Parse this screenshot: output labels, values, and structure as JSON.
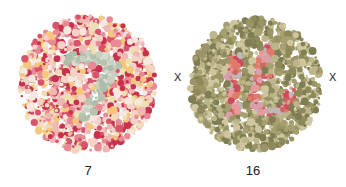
{
  "plates": [
    {
      "id": "plate-left",
      "caption": "7",
      "cx": 88,
      "cy": 84,
      "r": 70,
      "background_palette": [
        "#c8324e",
        "#d9536a",
        "#e88a95",
        "#f0b6b6",
        "#f3d2c8",
        "#f4c77a",
        "#efe0b0",
        "#f6e8e0"
      ],
      "figure_palette": [
        "#b7c3b0",
        "#c9d0c0",
        "#d8dcd0",
        "#aebcaa"
      ],
      "seed": 7
    },
    {
      "id": "plate-right",
      "caption": "16",
      "cx": 256,
      "cy": 84,
      "r": 68,
      "background_palette": [
        "#8c8a5a",
        "#a6a070",
        "#bdb68a",
        "#cfc6a0",
        "#9a9466",
        "#7f7d52"
      ],
      "figure_palette": [
        "#d0645f",
        "#e07a6a",
        "#c94e5a",
        "#e79a9a",
        "#d8a0a8",
        "#c0b8b8"
      ],
      "seed": 16
    }
  ],
  "markers": [
    {
      "text": "X",
      "x": 174,
      "y": 71
    },
    {
      "text": "X",
      "x": 329,
      "y": 71
    }
  ]
}
